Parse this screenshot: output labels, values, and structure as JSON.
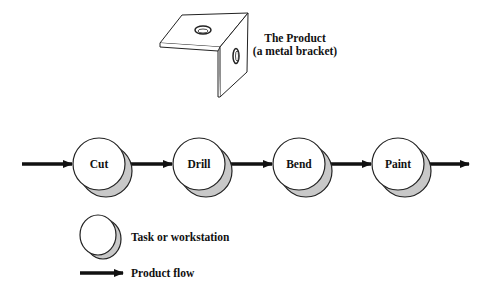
{
  "product": {
    "title_line1": "The Product",
    "title_line2": "(a metal bracket)",
    "icon": "metal-bracket-icon"
  },
  "flow": {
    "nodes": [
      {
        "label": "Cut",
        "cx": 99,
        "cy": 164
      },
      {
        "label": "Drill",
        "cx": 199,
        "cy": 164
      },
      {
        "label": "Bend",
        "cx": 299,
        "cy": 164
      },
      {
        "label": "Paint",
        "cx": 398,
        "cy": 164
      }
    ],
    "arrow_color": "#111111",
    "node_fill": "#ffffff",
    "shadow_fill": "#c8c8c8"
  },
  "legend": {
    "task_label": "Task or workstation",
    "flow_label": "Product flow"
  }
}
